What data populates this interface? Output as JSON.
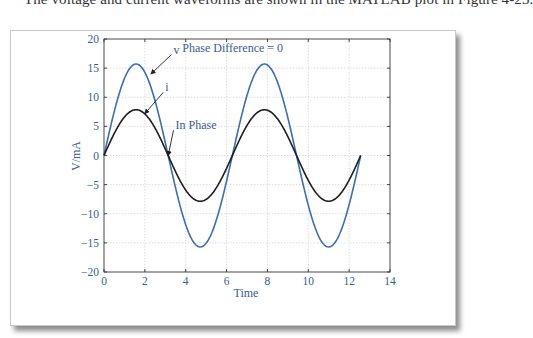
{
  "page": {
    "caption": "The voltage and current waveforms are shown in the MATLAB plot in Figure 4-23."
  },
  "chart_data": {
    "type": "line",
    "title": "",
    "xlabel": "Time",
    "ylabel": "V/mA",
    "xlim": [
      0,
      14
    ],
    "ylim": [
      -20,
      20
    ],
    "xticks": [
      0,
      2,
      4,
      6,
      8,
      10,
      12,
      14
    ],
    "yticks": [
      -20,
      -15,
      -10,
      -5,
      0,
      5,
      10,
      15,
      20
    ],
    "grid": true,
    "legend": null,
    "series": [
      {
        "name": "v",
        "color": "#3d6db3",
        "function": "15.7*sin(t)",
        "t_range": [
          0,
          12.566
        ],
        "x": [
          0,
          1.571,
          3.142,
          4.712,
          6.283,
          7.854,
          9.425,
          10.996,
          12.566
        ],
        "values": [
          0,
          15.7,
          0,
          -15.7,
          0,
          15.7,
          0,
          -15.7,
          0
        ]
      },
      {
        "name": "i",
        "color": "#1e1e1e",
        "function": "7.85*sin(t)",
        "t_range": [
          0,
          12.566
        ],
        "x": [
          0,
          1.571,
          3.142,
          4.712,
          6.283,
          7.854,
          9.425,
          10.996,
          12.566
        ],
        "values": [
          0,
          7.85,
          0,
          -7.85,
          0,
          7.85,
          0,
          -7.85,
          0
        ]
      }
    ],
    "annotations": [
      {
        "text": "Phase Difference = 0",
        "x": 6.3,
        "y": 17.8
      },
      {
        "text": "v",
        "x": 3.4,
        "y": 17.5,
        "arrow_to": [
          2.3,
          14.0
        ]
      },
      {
        "text": "i",
        "x": 3.0,
        "y": 11.0,
        "arrow_to": [
          2.0,
          7.2
        ]
      },
      {
        "text": "In Phase",
        "x": 3.5,
        "y": 4.5,
        "arrow_to": [
          3.14,
          0
        ]
      }
    ]
  }
}
